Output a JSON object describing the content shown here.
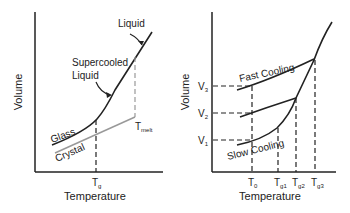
{
  "left_panel": {
    "xlabel": "Temperature",
    "ylabel": "Volume",
    "labels": {
      "liquid": "Liquid",
      "supercooled_1": "Supercooled",
      "supercooled_2": "Liquid",
      "glass": "Glass",
      "crystal": "Crystal",
      "tg_main": "T",
      "tg_sub": "g",
      "tmelt_main": "T",
      "tmelt_sub": "melt"
    },
    "colors": {
      "glass_line": "#222222",
      "crystal_line": "#999999"
    }
  },
  "right_panel": {
    "xlabel": "Temperature",
    "ylabel": "Volume",
    "labels": {
      "fast": "Fast Cooling",
      "slow": "Slow Cooling",
      "v3": "V",
      "v3_sub": "3",
      "v2": "V",
      "v2_sub": "2",
      "v1": "V",
      "v1_sub": "1",
      "t0": "T",
      "t0_sub": "0",
      "tg1": "T",
      "tg1_sub": "g1",
      "tg2": "T",
      "tg2_sub": "g2",
      "tg3": "T",
      "tg3_sub": "g3"
    }
  }
}
